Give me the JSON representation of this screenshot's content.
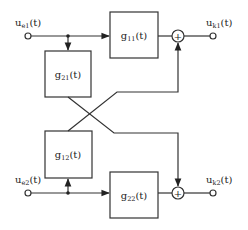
{
  "diagram": {
    "type": "MIMO block diagram (2x2 cross-coupled system)",
    "inputs": [
      {
        "id": "in1",
        "label": "u",
        "sub": "e1",
        "arg": "(t)"
      },
      {
        "id": "in2",
        "label": "u",
        "sub": "e2",
        "arg": "(t)"
      }
    ],
    "outputs": [
      {
        "id": "out1",
        "label": "u",
        "sub": "k1",
        "arg": "(t)"
      },
      {
        "id": "out2",
        "label": "u",
        "sub": "k2",
        "arg": "(t)"
      }
    ],
    "blocks": [
      {
        "id": "g11",
        "label": "g",
        "sub": "11",
        "arg": "(t)"
      },
      {
        "id": "g21",
        "label": "g",
        "sub": "21",
        "arg": "(t)"
      },
      {
        "id": "g12",
        "label": "g",
        "sub": "12",
        "arg": "(t)"
      },
      {
        "id": "g22",
        "label": "g",
        "sub": "22",
        "arg": "(t)"
      }
    ],
    "summers": [
      {
        "id": "sum1",
        "symbol": "+"
      },
      {
        "id": "sum2",
        "symbol": "+"
      }
    ],
    "colors": {
      "stroke": "#333333",
      "text": "#222222",
      "background": "#ffffff"
    }
  }
}
